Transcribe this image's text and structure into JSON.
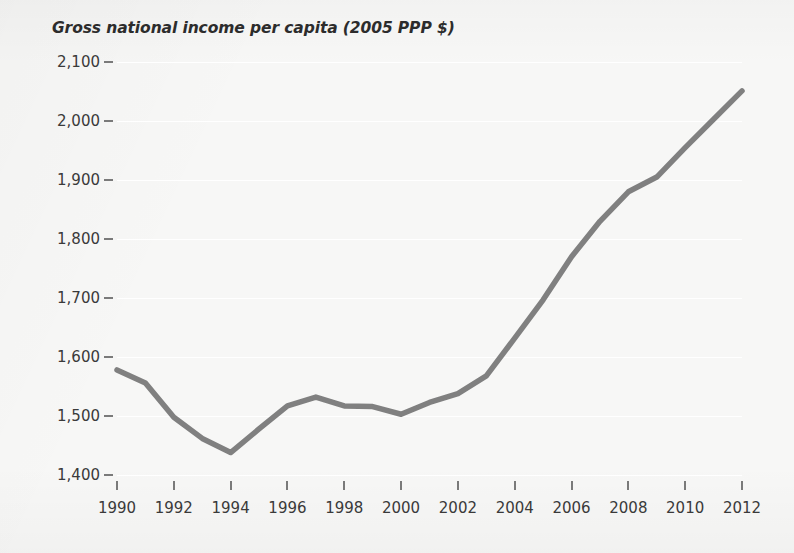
{
  "chart_data": {
    "type": "line",
    "title": "Gross national income per capita (2005 PPP $)",
    "xlabel": "",
    "ylabel": "",
    "xlim": [
      1990,
      2012
    ],
    "ylim": [
      1400,
      2100
    ],
    "grid": true,
    "legend": false,
    "legend_position": "none",
    "line_color": "#808080",
    "x": [
      1990,
      1991,
      1992,
      1993,
      1994,
      1995,
      1996,
      1997,
      1998,
      1999,
      2000,
      2001,
      2002,
      2003,
      2004,
      2005,
      2006,
      2007,
      2008,
      2009,
      2010,
      2011,
      2012
    ],
    "series": [
      {
        "name": "Gross national income per capita (2005 PPP $)",
        "values": [
          1578,
          1556,
          1498,
          1462,
          1438,
          1478,
          1517,
          1532,
          1517,
          1516,
          1503,
          1523,
          1538,
          1568,
          1632,
          1697,
          1770,
          1830,
          1880,
          1905,
          1955,
          2003,
          2051
        ]
      }
    ],
    "y_ticks": [
      1400,
      1500,
      1600,
      1700,
      1800,
      1900,
      2000,
      2100
    ],
    "y_tick_labels": [
      "1,400",
      "1,500",
      "1,600",
      "1,700",
      "1,800",
      "1,900",
      "2,000",
      "2,100"
    ],
    "x_ticks": [
      1990,
      1992,
      1994,
      1996,
      1998,
      2000,
      2002,
      2004,
      2006,
      2008,
      2010,
      2012
    ],
    "x_tick_labels": [
      "1990",
      "1992",
      "1994",
      "1996",
      "1998",
      "2000",
      "2002",
      "2004",
      "2006",
      "2008",
      "2010",
      "2012"
    ]
  }
}
